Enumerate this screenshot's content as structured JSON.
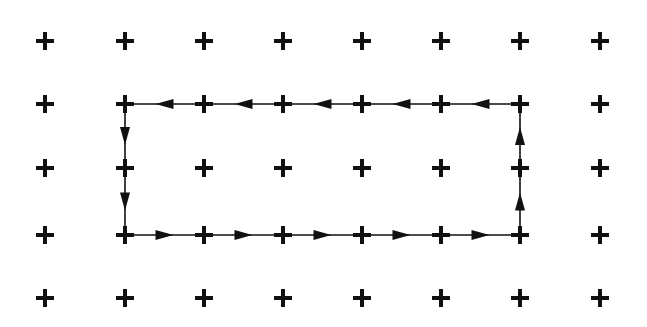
{
  "diagram": {
    "type": "lattice-loop",
    "background": "#ffffff",
    "stroke_color": "#111111",
    "grid": {
      "columns": 8,
      "rows": 5,
      "x_positions": [
        45,
        125,
        204,
        283,
        362,
        441,
        520,
        600
      ],
      "y_positions": [
        41,
        104,
        168,
        235,
        298
      ],
      "marker": "plus",
      "marker_size": 18,
      "marker_stroke": 4
    },
    "loop": {
      "direction": "counterclockwise",
      "corners": {
        "top_left": [
          1,
          1
        ],
        "top_right": [
          6,
          1
        ],
        "bottom_right": [
          6,
          3
        ],
        "bottom_left": [
          1,
          3
        ]
      },
      "edges": [
        {
          "from": [
            6,
            1
          ],
          "to": [
            5,
            1
          ]
        },
        {
          "from": [
            5,
            1
          ],
          "to": [
            4,
            1
          ]
        },
        {
          "from": [
            4,
            1
          ],
          "to": [
            3,
            1
          ]
        },
        {
          "from": [
            3,
            1
          ],
          "to": [
            2,
            1
          ]
        },
        {
          "from": [
            2,
            1
          ],
          "to": [
            1,
            1
          ]
        },
        {
          "from": [
            1,
            1
          ],
          "to": [
            1,
            2
          ]
        },
        {
          "from": [
            1,
            2
          ],
          "to": [
            1,
            3
          ]
        },
        {
          "from": [
            1,
            3
          ],
          "to": [
            2,
            3
          ]
        },
        {
          "from": [
            2,
            3
          ],
          "to": [
            3,
            3
          ]
        },
        {
          "from": [
            3,
            3
          ],
          "to": [
            4,
            3
          ]
        },
        {
          "from": [
            4,
            3
          ],
          "to": [
            5,
            3
          ]
        },
        {
          "from": [
            5,
            3
          ],
          "to": [
            6,
            3
          ]
        },
        {
          "from": [
            6,
            3
          ],
          "to": [
            6,
            2
          ]
        },
        {
          "from": [
            6,
            2
          ],
          "to": [
            6,
            1
          ]
        }
      ]
    }
  }
}
